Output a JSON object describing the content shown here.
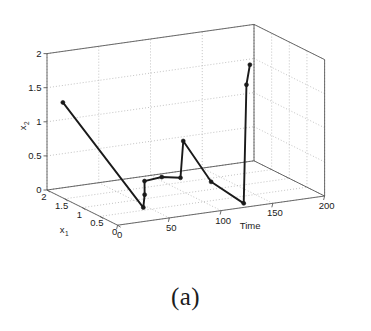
{
  "figure": {
    "caption": "(a)",
    "background_color": "#ffffff",
    "line_color": "#1a1a1a",
    "grid_color": "#9a9a9a",
    "axis_color": "#5a5a5a",
    "marker_color": "#1a1a1a"
  },
  "chart_data": {
    "type": "line",
    "title": "",
    "subtitle": "",
    "projection": "3d",
    "xlabel": "Time",
    "ylabel": "x_1",
    "zlabel": "x_2",
    "xlim": [
      0,
      200
    ],
    "ylim": [
      0,
      2
    ],
    "zlim": [
      0,
      2
    ],
    "xticks": [
      0,
      50,
      100,
      150,
      200
    ],
    "yticks": [
      0,
      0.5,
      1,
      1.5,
      2
    ],
    "zticks": [
      0,
      0.5,
      1,
      1.5,
      2
    ],
    "xtick_labels": [
      "0",
      "50",
      "100",
      "150",
      "200"
    ],
    "ytick_labels": [
      "0",
      "0.5",
      "1",
      "1.5",
      "2"
    ],
    "ztick_labels": [
      "0",
      "0.5",
      "1",
      "1.5",
      "2"
    ],
    "grid": true,
    "legend": false,
    "legend_position": "none",
    "y_axis_reversed": true,
    "marker": "filled-circle",
    "series": [
      {
        "name": "trajectory",
        "points": [
          {
            "time": 0,
            "x1": 1.55,
            "x2": 1.4
          },
          {
            "time": 46,
            "x1": 0.62,
            "x2": 0.0
          },
          {
            "time": 50,
            "x1": 0.7,
            "x2": 0.16
          },
          {
            "time": 56,
            "x1": 0.88,
            "x2": 0.3
          },
          {
            "time": 72,
            "x1": 0.86,
            "x2": 0.33
          },
          {
            "time": 86,
            "x1": 0.74,
            "x2": 0.32
          },
          {
            "time": 88,
            "x1": 0.72,
            "x2": 0.86
          },
          {
            "time": 104,
            "x1": 0.4,
            "x2": 0.31
          },
          {
            "time": 128,
            "x1": 0.18,
            "x2": 0.0
          },
          {
            "time": 132,
            "x1": 0.22,
            "x2": 1.72
          },
          {
            "time": 136,
            "x1": 0.24,
            "x2": 2.0
          }
        ]
      }
    ],
    "annotations": []
  },
  "axes": {
    "z_label": "x",
    "z_label_sub": "2",
    "y_label": "x",
    "y_label_sub": "1",
    "x_label": "Time"
  }
}
